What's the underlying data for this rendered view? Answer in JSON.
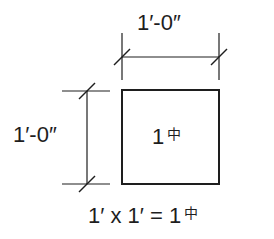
{
  "diagram": {
    "width_dimension": {
      "label": "1′-0″"
    },
    "height_dimension": {
      "label": "1′-0″"
    },
    "square": {
      "value": "1",
      "unit_symbol": "中"
    },
    "equation": {
      "text": "1′ x 1′ = 1",
      "unit_symbol": "中"
    },
    "colors": {
      "line": "#1e1e1e",
      "background": "#ffffff"
    }
  }
}
